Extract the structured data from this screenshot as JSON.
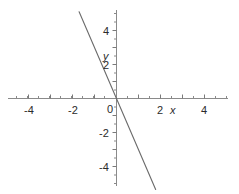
{
  "chart_data": {
    "type": "line",
    "title": "",
    "subtitle": "",
    "xlabel": "x",
    "ylabel": "y",
    "xlim": [
      -5.4,
      5.1
    ],
    "ylim": [
      -5.6,
      5.1
    ],
    "grid": false,
    "legend": null,
    "equation": "y = -3x",
    "slope": -3,
    "intercept": 0,
    "series": [
      {
        "name": "y = -3x",
        "color": "#6b6b6b",
        "x": [
          -1.7,
          1.78
        ],
        "y": [
          5.1,
          -5.35
        ],
        "points": [
          {
            "x": -1.7,
            "y": 5.1
          },
          {
            "x": -1.0,
            "y": 3.0
          },
          {
            "x": 0.0,
            "y": 0.0
          },
          {
            "x": 1.0,
            "y": -3.0
          },
          {
            "x": 1.78,
            "y": -5.35
          }
        ]
      }
    ],
    "x_ticks_major": [
      -4,
      -2,
      0,
      2,
      4
    ],
    "x_tick_labels": [
      "-4",
      "-2",
      "0",
      "2",
      "4"
    ],
    "y_ticks_major": [
      4,
      2,
      0,
      -2,
      -4
    ],
    "y_tick_labels": [
      "4",
      "2",
      "0",
      "-2",
      "-4"
    ],
    "minor_tick_step": 0.5,
    "axis_color": "#8a8a8a",
    "line_color": "#6b6b6b",
    "text_color": "#2b2b2b",
    "background": "#ffffff"
  },
  "labels": {
    "x_neg4": "-4",
    "x_neg2": "-2",
    "x_zero": "0",
    "x_pos2": "2",
    "x_pos4": "4",
    "y_pos4": "4",
    "y_pos2": "2",
    "y_neg2": "-2",
    "y_neg4": "-4",
    "x_axis_name": "x",
    "y_axis_name": "y"
  }
}
